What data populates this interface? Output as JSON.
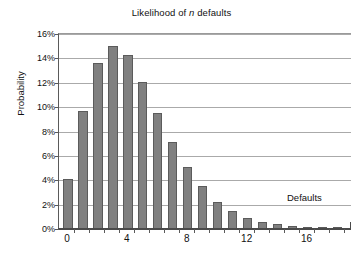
{
  "chart_data": {
    "type": "bar",
    "title": "Likelihood of n defaults",
    "title_prefix": "Likelihood of ",
    "title_italic": "n",
    "title_suffix": " defaults",
    "xlabel": "Defaults",
    "ylabel": "Probability",
    "axis_annotation": "Defaults",
    "categories": [
      0,
      1,
      2,
      3,
      4,
      5,
      6,
      7,
      8,
      9,
      10,
      11,
      12,
      13,
      14,
      15,
      16,
      17,
      18
    ],
    "values": [
      4.1,
      9.65,
      13.6,
      15.0,
      14.3,
      12.1,
      9.55,
      7.15,
      5.05,
      3.5,
      2.25,
      1.5,
      0.9,
      0.6,
      0.4,
      0.25,
      0.15,
      0.07,
      0.08
    ],
    "value_unit": "%",
    "ylim": [
      0,
      16
    ],
    "ytick_values": [
      0,
      2,
      4,
      6,
      8,
      10,
      12,
      14,
      16
    ],
    "ytick_labels": [
      "0%",
      "2%",
      "4%",
      "6%",
      "8%",
      "10%",
      "12%",
      "14%",
      "16%"
    ],
    "xtick_values": [
      0,
      4,
      8,
      12,
      16
    ],
    "xtick_labels": [
      "0",
      "4",
      "8",
      "12",
      "16"
    ],
    "xlim": [
      -0.6,
      18.9
    ],
    "grid": "horizontal",
    "legend": "none",
    "bar_color": "#808080",
    "bar_edge_color": "#5b5b5b",
    "gridline_color": "#aaaaaa",
    "axis_color": "#4a4a4a",
    "background_color": "#ffffff"
  }
}
